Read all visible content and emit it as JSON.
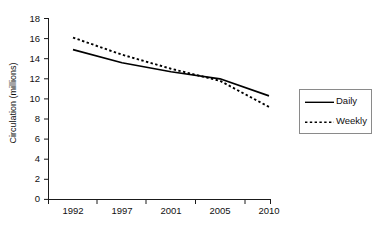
{
  "chart_data": {
    "type": "line",
    "title": "",
    "subtitle": "",
    "xlabel": "",
    "ylabel": "Circulation (millions)",
    "categories": [
      "1992",
      "1997",
      "2001",
      "2005",
      "2010"
    ],
    "xtick_labels": [
      "1992",
      "1997",
      "2001",
      "2005",
      "2010"
    ],
    "ytick_labels": [
      "0",
      "2",
      "4",
      "6",
      "8",
      "10",
      "12",
      "14",
      "16",
      "18"
    ],
    "yticks": [
      0,
      2,
      4,
      6,
      8,
      10,
      12,
      14,
      16,
      18
    ],
    "ylim": [
      0,
      18
    ],
    "grid": false,
    "legend_position": "right",
    "series": [
      {
        "name": "Daily",
        "style": "solid",
        "color": "#000000",
        "values": [
          14.9,
          13.6,
          12.7,
          12.0,
          10.3
        ]
      },
      {
        "name": "Weekly",
        "style": "dotted",
        "color": "#000000",
        "values": [
          16.1,
          14.4,
          13.0,
          11.8,
          9.2
        ]
      }
    ]
  },
  "legend": {
    "entries": [
      {
        "label": "Daily",
        "style": "solid"
      },
      {
        "label": "Weekly",
        "style": "dotted"
      }
    ]
  },
  "axes": {
    "y_title": "Circulation (millions)"
  }
}
